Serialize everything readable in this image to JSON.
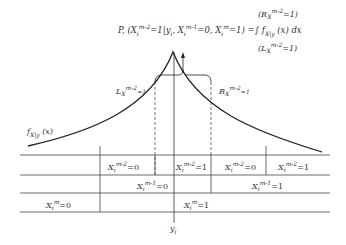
{
  "diagram": {
    "formula": {
      "lhs": "P, (X",
      "lhs_rest": "=1|y",
      "lhs_cond": ", X",
      "lhs_cond2": "=0, X",
      "lhs_end": "=1) =∫ f",
      "integrand": "(x) dx",
      "upper_limit": "(R",
      "upper_limit_sub": "=1)",
      "lower_limit": "(L",
      "lower_limit_sub": "=1)",
      "full_text": "P, (X_i^{m-2}=1|y_i, X_i^{m-1}=0, X_i^m=1) = ∫_{L}^{R} f_{X|y}(x) dx"
    },
    "curve_label": "f_{X|y}(x)",
    "left_bound_label": "L_{X_i^{m-2}=1}",
    "right_bound_label": "R_{X_i^{m-2}=1}",
    "axis_label": "y_i",
    "table": {
      "rows": [
        {
          "cells": [
            "X_i^{m-2}=0",
            "X_i^{m-2}=1",
            "X_i^{m-2}=0",
            "X_i^{m-2}=1"
          ]
        },
        {
          "cells": [
            "X_i^{m-1}=0",
            "X_i^{m-1}=1"
          ]
        },
        {
          "cells": [
            "X_i^m=0",
            "X_i^m=1"
          ]
        }
      ]
    },
    "labels": {
      "r0c0": "X",
      "r0c0_sup": "m-2",
      "r0c0_val": "=0",
      "r0c1": "X",
      "r0c1_sup": "m-2",
      "r0c1_val": "=1",
      "r0c2": "X",
      "r0c2_sup": "m-2",
      "r0c2_val": "=0",
      "r0c3": "X",
      "r0c3_sup": "m-2",
      "r0c3_val": "=1",
      "r1c0": "X",
      "r1c0_sup": "m-1",
      "r1c0_val": "=0",
      "r1c1": "X",
      "r1c1_sup": "m-1",
      "r1c1_val": "=1",
      "r2c0": "X",
      "r2c0_sup": "m",
      "r2c0_val": "=0",
      "r2c1": "X",
      "r2c1_sup": "m",
      "r2c1_val": "=1",
      "sub_i": "i",
      "y": "y",
      "f": "f",
      "f_sub": "X|y",
      "f_arg": "(x)",
      "L": "L",
      "R": "R",
      "bound_sub": "X",
      "bound_sup": "m-2",
      "bound_val": "=1"
    }
  }
}
